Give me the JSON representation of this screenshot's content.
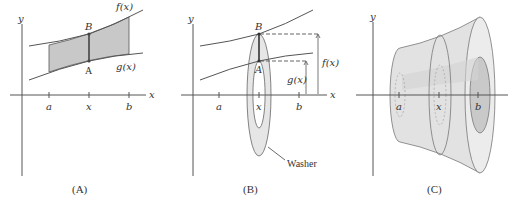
{
  "figure": {
    "panels": [
      {
        "caption": "(A)",
        "axis_x": "x",
        "axis_y": "y",
        "ticks": [
          "a",
          "x",
          "b"
        ],
        "curve_top": "f(x)",
        "curve_bottom": "g(x)",
        "point_top": "B",
        "point_bottom": "A"
      },
      {
        "caption": "(B)",
        "axis_x": "x",
        "axis_y": "y",
        "ticks": [
          "a",
          "x",
          "b"
        ],
        "point_top": "B",
        "point_bottom": "A",
        "height_outer": "f(x)",
        "height_inner": "g(x)",
        "callout": "Washer"
      },
      {
        "caption": "(C)",
        "axis_y": "y",
        "ticks": [
          "a",
          "x",
          "b"
        ]
      }
    ],
    "colors": {
      "shade": "#c8c8c8",
      "washer": "#e6e6e6",
      "solid": "#e2e2e2",
      "line": "#555555"
    }
  }
}
